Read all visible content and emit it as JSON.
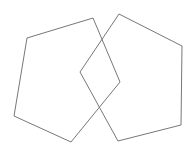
{
  "diagram": {
    "width": 193,
    "height": 155,
    "background": "#ffffff",
    "stroke_color": "#777777",
    "shapes": [
      {
        "type": "pentagon",
        "name": "left-pentagon",
        "points": "93,18 120,82 71,142 14,116 27,38"
      },
      {
        "type": "pentagon",
        "name": "right-pentagon",
        "points": "119,14 182,46 181,125 118,141 80,72"
      }
    ]
  }
}
